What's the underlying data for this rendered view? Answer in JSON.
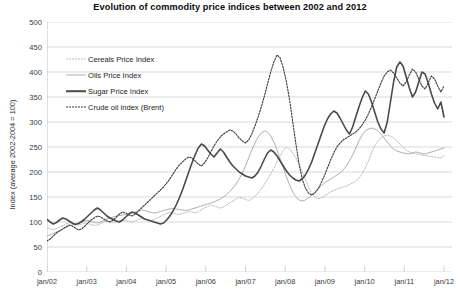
{
  "chart_data": {
    "type": "line",
    "title": "Evolution of commodity price indices between 2002 and 2012",
    "xlabel": "",
    "ylabel": "Index (average 2002-2004 = 100)",
    "ylim": [
      0,
      500
    ],
    "ytick_values": [
      0,
      50,
      100,
      150,
      200,
      250,
      300,
      350,
      400,
      450,
      500
    ],
    "ytick_labels": [
      "0",
      "50",
      "100",
      "150",
      "200",
      "250",
      "300",
      "350",
      "400",
      "450",
      "500"
    ],
    "xtick_labels": [
      "jan/02",
      "jan/03",
      "jan/04",
      "jan/05",
      "jan/06",
      "jan/07",
      "jan/08",
      "jan/09",
      "jan/10",
      "jan/11",
      "jan/12"
    ],
    "xtick_positions": [
      0,
      12,
      24,
      36,
      48,
      60,
      72,
      84,
      96,
      108,
      120
    ],
    "x_count": 127,
    "grid": true,
    "legend_position": "upper-left-inside",
    "series": [
      {
        "name": "Cereals Price Index",
        "style": "dotted",
        "color": "#bdbdbd",
        "width": 1.0,
        "values": [
          88,
          86,
          85,
          87,
          90,
          93,
          96,
          99,
          97,
          95,
          94,
          96,
          98,
          97,
          95,
          93,
          94,
          97,
          100,
          103,
          101,
          99,
          100,
          102,
          104,
          103,
          101,
          100,
          102,
          105,
          107,
          106,
          104,
          103,
          105,
          108,
          111,
          114,
          117,
          120,
          118,
          116,
          115,
          117,
          119,
          121,
          120,
          118,
          120,
          124,
          128,
          131,
          134,
          132,
          130,
          128,
          130,
          134,
          138,
          142,
          146,
          150,
          148,
          145,
          143,
          146,
          152,
          158,
          166,
          175,
          185,
          196,
          208,
          220,
          232,
          243,
          250,
          246,
          238,
          228,
          215,
          200,
          185,
          170,
          158,
          150,
          146,
          148,
          152,
          156,
          160,
          163,
          166,
          168,
          170,
          172,
          175,
          178,
          182,
          188,
          196,
          208,
          222,
          238,
          252,
          262,
          268,
          272,
          274,
          272,
          268,
          262,
          256,
          250,
          244,
          240,
          238,
          236,
          235,
          234,
          233,
          232,
          231,
          230,
          229,
          228,
          232
        ]
      },
      {
        "name": "Oils Price Index",
        "style": "solid",
        "color": "#b0b0b0",
        "width": 1.0,
        "values": [
          72,
          74,
          77,
          80,
          83,
          86,
          89,
          92,
          94,
          96,
          98,
          100,
          102,
          103,
          101,
          99,
          98,
          100,
          103,
          106,
          108,
          110,
          112,
          113,
          114,
          115,
          116,
          118,
          120,
          122,
          124,
          123,
          121,
          119,
          118,
          119,
          121,
          123,
          125,
          126,
          127,
          126,
          125,
          124,
          123,
          124,
          126,
          128,
          130,
          132,
          134,
          136,
          138,
          140,
          143,
          146,
          150,
          155,
          161,
          168,
          176,
          186,
          198,
          212,
          228,
          244,
          258,
          270,
          278,
          282,
          280,
          272,
          260,
          244,
          226,
          208,
          190,
          174,
          160,
          150,
          144,
          142,
          144,
          148,
          154,
          160,
          166,
          172,
          178,
          182,
          186,
          190,
          194,
          198,
          204,
          212,
          222,
          234,
          248,
          262,
          274,
          282,
          286,
          288,
          286,
          282,
          276,
          268,
          260,
          252,
          246,
          242,
          240,
          238,
          237,
          236,
          238,
          240,
          239,
          237,
          236,
          238,
          240,
          242,
          244,
          246,
          248
        ]
      },
      {
        "name": "Sugar Price Index",
        "style": "solid",
        "color": "#4a4a4a",
        "width": 1.6,
        "values": [
          105,
          100,
          96,
          99,
          104,
          108,
          106,
          102,
          98,
          95,
          97,
          101,
          106,
          112,
          118,
          124,
          128,
          124,
          118,
          112,
          108,
          105,
          102,
          100,
          104,
          110,
          116,
          120,
          118,
          114,
          110,
          106,
          104,
          102,
          100,
          98,
          96,
          98,
          104,
          112,
          122,
          134,
          148,
          164,
          182,
          200,
          218,
          234,
          248,
          256,
          252,
          244,
          236,
          230,
          238,
          246,
          240,
          230,
          220,
          212,
          206,
          200,
          196,
          192,
          190,
          188,
          192,
          200,
          212,
          226,
          238,
          244,
          240,
          232,
          222,
          212,
          202,
          194,
          188,
          184,
          182,
          186,
          194,
          206,
          220,
          238,
          256,
          274,
          292,
          306,
          316,
          322,
          318,
          308,
          296,
          284,
          276,
          290,
          310,
          330,
          348,
          362,
          356,
          340,
          320,
          300,
          286,
          278,
          300,
          340,
          380,
          410,
          420,
          412,
          390,
          368,
          350,
          360,
          380,
          400,
          396,
          378,
          356,
          338,
          326,
          340,
          310
        ]
      },
      {
        "name": "Crude oil index (Brent)",
        "style": "dotted",
        "color": "#3a3a3a",
        "width": 1.1,
        "values": [
          62,
          66,
          72,
          78,
          82,
          86,
          90,
          94,
          92,
          88,
          84,
          86,
          92,
          98,
          104,
          108,
          112,
          110,
          106,
          102,
          100,
          104,
          110,
          116,
          120,
          118,
          114,
          112,
          116,
          122,
          128,
          134,
          140,
          146,
          152,
          158,
          164,
          170,
          178,
          186,
          196,
          206,
          214,
          220,
          226,
          230,
          228,
          222,
          216,
          212,
          218,
          228,
          240,
          252,
          262,
          270,
          276,
          280,
          284,
          282,
          276,
          268,
          262,
          258,
          264,
          276,
          292,
          310,
          330,
          352,
          376,
          400,
          420,
          434,
          428,
          408,
          380,
          344,
          300,
          256,
          216,
          186,
          168,
          158,
          154,
          158,
          166,
          178,
          192,
          208,
          224,
          238,
          250,
          258,
          264,
          268,
          272,
          276,
          280,
          286,
          294,
          304,
          316,
          330,
          346,
          362,
          378,
          392,
          400,
          404,
          398,
          388,
          378,
          372,
          380,
          394,
          406,
          400,
          386,
          372,
          366,
          378,
          392,
          386,
          372,
          360,
          372
        ]
      }
    ]
  }
}
